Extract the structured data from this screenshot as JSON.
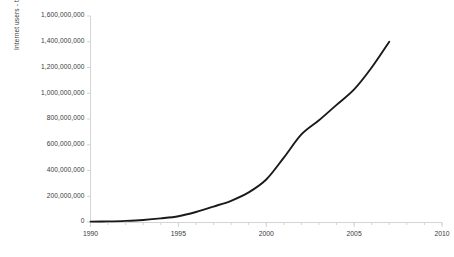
{
  "chart_data": {
    "type": "line",
    "title": "",
    "xlabel": "",
    "ylabel": "Internet users - total worldwide",
    "xlim": [
      1990,
      2010
    ],
    "ylim": [
      0,
      1600000000
    ],
    "grid": false,
    "legend": null,
    "line_color": "#1a1a1a",
    "axis_color": "#d4d4d4",
    "text_color": "#3a3a3a",
    "x_tick_labels": [
      "1990",
      "1995",
      "2000",
      "2005",
      "2010"
    ],
    "x_tick_values": [
      1990,
      1995,
      2000,
      2005,
      2010
    ],
    "x_minor_tick_interval": 1,
    "y_tick_labels": [
      "0",
      "200,000,000",
      "400,000,000",
      "600,000,000",
      "800,000,000",
      "1,000,000,000",
      "1,200,000,000",
      "1,400,000,000",
      "1,600,000,000"
    ],
    "y_tick_values": [
      0,
      200000000,
      400000000,
      600000000,
      800000000,
      1000000000,
      1200000000,
      1400000000,
      1600000000
    ],
    "x": [
      1990,
      1991,
      1992,
      1993,
      1994,
      1995,
      1996,
      1997,
      1998,
      1999,
      2000,
      2001,
      2002,
      2003,
      2004,
      2005,
      2006,
      2007
    ],
    "values": [
      3000000,
      5000000,
      9000000,
      16000000,
      28000000,
      45000000,
      78000000,
      120000000,
      165000000,
      230000000,
      330000000,
      500000000,
      680000000,
      790000000,
      910000000,
      1030000000,
      1200000000,
      1400000000
    ],
    "series": [
      {
        "name": "Internet users - total worldwide",
        "values": [
          3000000,
          5000000,
          9000000,
          16000000,
          28000000,
          45000000,
          78000000,
          120000000,
          165000000,
          230000000,
          330000000,
          500000000,
          680000000,
          790000000,
          910000000,
          1030000000,
          1200000000,
          1400000000
        ]
      }
    ]
  }
}
